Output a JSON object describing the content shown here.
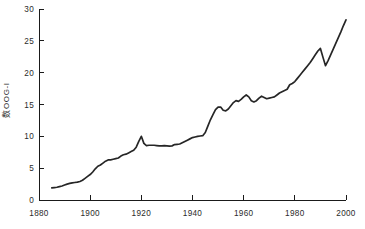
{
  "chart_data": {
    "type": "line",
    "title": "",
    "xlabel": "",
    "ylabel": "数OOG-I",
    "xlim": [
      1880,
      2000
    ],
    "ylim": [
      0,
      30
    ],
    "xticks": [
      1880,
      1900,
      1920,
      1940,
      1960,
      1980,
      2000
    ],
    "yticks": [
      0,
      5,
      10,
      15,
      20,
      25,
      30
    ],
    "xtick_labels": [
      "1880",
      "1900",
      "1920",
      "1940",
      "1960",
      "1980",
      "2000"
    ],
    "ytick_labels": [
      "0",
      "5",
      "10",
      "15",
      "20",
      "25",
      "30"
    ],
    "grid": false,
    "legend": false,
    "line_color": "#262626",
    "axis_color": "#1a1a1a",
    "background": "#ffffff",
    "series": [
      {
        "name": "series-1",
        "x": [
          1885,
          1886,
          1887,
          1888,
          1889,
          1890,
          1891,
          1892,
          1893,
          1894,
          1895,
          1896,
          1897,
          1898,
          1899,
          1900,
          1901,
          1902,
          1903,
          1904,
          1905,
          1906,
          1907,
          1908,
          1909,
          1910,
          1911,
          1912,
          1913,
          1914,
          1915,
          1916,
          1917,
          1918,
          1919,
          1920,
          1921,
          1922,
          1923,
          1924,
          1925,
          1926,
          1927,
          1928,
          1929,
          1930,
          1931,
          1932,
          1933,
          1934,
          1935,
          1936,
          1937,
          1938,
          1939,
          1940,
          1941,
          1942,
          1943,
          1944,
          1945,
          1946,
          1947,
          1948,
          1949,
          1950,
          1951,
          1952,
          1953,
          1954,
          1955,
          1956,
          1957,
          1958,
          1959,
          1960,
          1961,
          1962,
          1963,
          1964,
          1965,
          1966,
          1967,
          1968,
          1969,
          1970,
          1971,
          1972,
          1973,
          1974,
          1975,
          1976,
          1977,
          1978,
          1979,
          1980,
          1981,
          1982,
          1983,
          1984,
          1985,
          1986,
          1987,
          1988,
          1989,
          1990,
          1991,
          1992,
          1993,
          1994,
          1995,
          1996,
          1997,
          1998,
          1999,
          2000
        ],
        "y": [
          1.9,
          1.95,
          2.0,
          2.1,
          2.2,
          2.35,
          2.5,
          2.6,
          2.7,
          2.75,
          2.8,
          2.9,
          3.1,
          3.4,
          3.7,
          4.0,
          4.4,
          4.9,
          5.3,
          5.5,
          5.8,
          6.1,
          6.3,
          6.3,
          6.4,
          6.5,
          6.6,
          6.9,
          7.1,
          7.2,
          7.4,
          7.6,
          7.8,
          8.3,
          9.2,
          10.0,
          8.9,
          8.55,
          8.6,
          8.6,
          8.6,
          8.55,
          8.5,
          8.5,
          8.55,
          8.5,
          8.45,
          8.5,
          8.7,
          8.75,
          8.8,
          9.0,
          9.2,
          9.4,
          9.6,
          9.8,
          9.9,
          10.0,
          10.05,
          10.1,
          10.6,
          11.6,
          12.6,
          13.4,
          14.2,
          14.6,
          14.6,
          14.1,
          14.0,
          14.3,
          14.8,
          15.3,
          15.6,
          15.5,
          15.8,
          16.2,
          16.5,
          16.2,
          15.6,
          15.4,
          15.6,
          16.0,
          16.3,
          16.1,
          15.9,
          16.0,
          16.1,
          16.2,
          16.5,
          16.8,
          17.0,
          17.2,
          17.4,
          18.1,
          18.3,
          18.6,
          19.1,
          19.6,
          20.1,
          20.6,
          21.1,
          21.6,
          22.2,
          22.8,
          23.4,
          23.8,
          22.4,
          21.1,
          21.9,
          22.8,
          23.7,
          24.6,
          25.5,
          26.4,
          27.4,
          28.3
        ]
      }
    ]
  }
}
